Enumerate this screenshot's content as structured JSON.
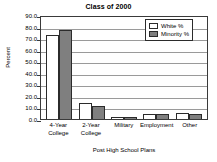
{
  "chart_data": {
    "type": "bar",
    "title": "Class of 2000",
    "xlabel": "Post High School Plans",
    "ylabel": "Percent",
    "categories": [
      "4-Year College",
      "2-Year College",
      "Military",
      "Employment",
      "Other"
    ],
    "category_lines": [
      [
        "4-Year",
        "College"
      ],
      [
        "2-Year",
        "College"
      ],
      [
        "Military"
      ],
      [
        "Employment"
      ],
      [
        "Other"
      ]
    ],
    "series": [
      {
        "name": "White %",
        "values": [
          73.0,
          13.5,
          1.5,
          4.5,
          5.5
        ],
        "color": "#ffffff"
      },
      {
        "name": "Minority %",
        "values": [
          77.0,
          11.0,
          2.0,
          4.5,
          4.5
        ],
        "color": "#7f7f7f"
      }
    ],
    "ylim": [
      0.0,
      90.0
    ],
    "ytick_values": [
      90.0,
      80.0,
      70.0,
      60.0,
      50.0,
      40.0,
      30.0,
      20.0,
      10.0,
      0.0
    ],
    "ytick_labels": [
      "90.0",
      "80.0",
      "70.0",
      "60.0",
      "50.0",
      "40.0",
      "30.0",
      "20.0",
      "10.0",
      "0.0"
    ],
    "grid": true,
    "grid_axis": "y",
    "legend_position": "top-right",
    "legend_entries": [
      "White %",
      "Minority %"
    ]
  }
}
